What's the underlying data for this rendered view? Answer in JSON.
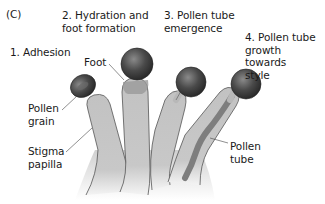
{
  "panel_label": "(C)",
  "stages": [
    {
      "number": "1.",
      "title": "Adhesion"
    },
    {
      "number": "2.",
      "title": "Hydration and\nfoot formation"
    },
    {
      "number": "3.",
      "title": "Pollen tube\nemergence"
    },
    {
      "number": "4.",
      "title": "Pollen tube\ngrowth towards\nstyle"
    }
  ],
  "stage_labels": [
    "1. Adhesion",
    "2. Hydration and\nfoot formation",
    "3. Pollen tube\nemergence",
    "4. Pollen tube\ngrowth towards\nstyle"
  ],
  "callouts": {
    "foot": "Foot",
    "pollen_grain": "Pollen\ngrain",
    "stigma_papilla": "Stigma\npapilla",
    "pollen_tube": "Pollen\ntube"
  },
  "colors": {
    "papilla_fill": "#c4c4c4",
    "papilla_stroke": "#555555",
    "pollen_dark": "#3a3a3a",
    "pollen_tube": "#8a8a8a",
    "leader_line": "#444444"
  }
}
